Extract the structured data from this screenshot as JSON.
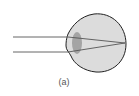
{
  "figure": {
    "caption": "(a)",
    "colors": {
      "eyeball_fill": "#dcdcdc",
      "eyeball_outline": "#222222",
      "lens_fill": "#9a9a9a",
      "ray_color": "#555555"
    },
    "rays": [
      {
        "name": "upper-ray"
      },
      {
        "name": "lower-ray"
      }
    ]
  }
}
